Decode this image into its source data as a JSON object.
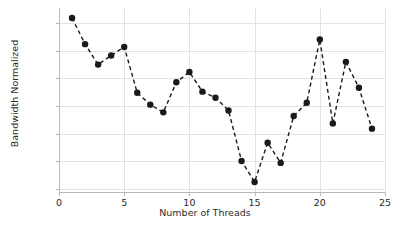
{
  "chart_data": {
    "type": "line",
    "title": "",
    "xlabel": "Number of Threads",
    "ylabel": "Bandwidth Normalized",
    "xlim": [
      0,
      25
    ],
    "ylim": [
      0.9385,
      1.0055
    ],
    "xticks": [
      0,
      5,
      10,
      15,
      20,
      25
    ],
    "xtick_labels": [
      "0",
      "5",
      "10",
      "15",
      "20",
      "25"
    ],
    "yticks": [
      0.94,
      0.95,
      0.96,
      0.97,
      0.98,
      0.99,
      1.0
    ],
    "ytick_labels": [
      "0.94",
      "0.95",
      "0.96",
      "0.97",
      "0.98",
      "0.99",
      "1.00"
    ],
    "grid": true,
    "legend": false,
    "legend_position": "none",
    "marker": "circle",
    "linestyle": "dashed",
    "color": "#1a1a1a",
    "x": [
      1,
      2,
      3,
      4,
      5,
      6,
      7,
      8,
      9,
      10,
      11,
      12,
      13,
      14,
      15,
      16,
      17,
      18,
      19,
      20,
      21,
      22,
      23,
      24
    ],
    "values": [
      1.0019,
      0.9924,
      0.985,
      0.9883,
      0.9914,
      0.9748,
      0.9705,
      0.9677,
      0.9786,
      0.9823,
      0.9752,
      0.973,
      0.9684,
      0.9501,
      0.9425,
      0.9567,
      0.9494,
      0.9664,
      0.9712,
      0.9941,
      0.9637,
      0.986,
      0.9766,
      0.9618
    ],
    "series": [
      {
        "name": "Bandwidth Normalized",
        "values": [
          1.0019,
          0.9924,
          0.985,
          0.9883,
          0.9914,
          0.9748,
          0.9705,
          0.9677,
          0.9786,
          0.9823,
          0.9752,
          0.973,
          0.9684,
          0.9501,
          0.9425,
          0.9567,
          0.9494,
          0.9664,
          0.9712,
          0.9941,
          0.9637,
          0.986,
          0.9766,
          0.9618
        ]
      }
    ]
  }
}
